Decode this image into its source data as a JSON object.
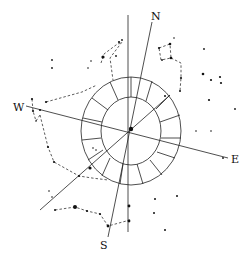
{
  "diagram": {
    "labels": {
      "north": "N",
      "south": "S",
      "east": "E",
      "west": "W"
    },
    "colors": {
      "ink": "#111111",
      "background": "#ffffff"
    },
    "center": {
      "x": 131,
      "y": 130
    }
  }
}
